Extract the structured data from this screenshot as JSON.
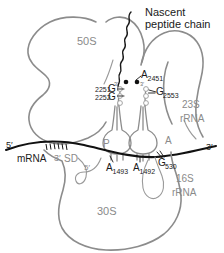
{
  "figure": {
    "colors": {
      "outline": "#8c8c8c",
      "label_gray": "#8a8a8a",
      "label_dark": "#1a1a1a",
      "mrna": "#111111"
    }
  },
  "labels": {
    "nascent_line1": "Nascent",
    "nascent_line2": "peptide chain",
    "subunit_50s": "50S",
    "subunit_30s": "30S",
    "rrna_23s_line1": "23S",
    "rrna_23s_line2": "rRNA",
    "rrna_16s_line1": "16S",
    "rrna_16s_line2": "rRNA",
    "site_p": "P",
    "site_a": "A",
    "mrna": "mRNA",
    "sd": "SD",
    "mrna_five_prime": "5′",
    "mrna_three_prime_left": "3′",
    "mrna_three_prime_right": "3′",
    "trna_three_prime_p": "3′",
    "trna_three_prime_a": "3′",
    "trna_five_prime_30s": "5′"
  },
  "residues": [
    {
      "id": "a2451",
      "base": "A",
      "number": "2451"
    },
    {
      "id": "g2553",
      "base": "G",
      "number": "2553"
    },
    {
      "id": "g2251",
      "base": "G",
      "number": "2251",
      "number_position": "pre"
    },
    {
      "id": "g2252",
      "base": "G",
      "number": "2252",
      "number_position": "pre"
    },
    {
      "id": "a1493",
      "base": "A",
      "number": "1493"
    },
    {
      "id": "a1492",
      "base": "A",
      "number": "1492"
    },
    {
      "id": "g530",
      "base": "G",
      "number": "530"
    }
  ]
}
